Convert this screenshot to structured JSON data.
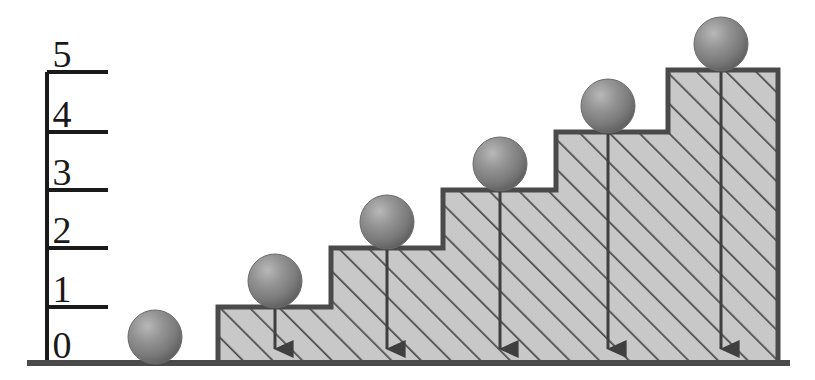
{
  "figure": {
    "background_color": "#ffffff",
    "line_color": "#4a4a4a",
    "axis_color": "#1a1a1a",
    "hatch_fill_color": "#c8c8c8",
    "hatch_line_color": "#4a4a4a",
    "ball_color": "#808080",
    "ball_highlight_color": "#b5b5b5",
    "ball_shadow_color": "#555555"
  },
  "axis": {
    "name": "vertical-level-axis",
    "x": 47,
    "top_y": 72,
    "bottom_y": 363,
    "tick_end_x": 108,
    "labels": [
      "0",
      "1",
      "2",
      "3",
      "4",
      "5"
    ],
    "tick_y": [
      363,
      307,
      248,
      190,
      132,
      72
    ],
    "label_x": [
      62,
      62,
      62,
      62,
      62,
      62
    ],
    "label_y": [
      362,
      306,
      247,
      189,
      131,
      71
    ]
  },
  "ground": {
    "name": "ground-line",
    "x1": 27,
    "x2": 790,
    "y": 363
  },
  "chart_data": {
    "type": "bar",
    "title": "Staircase of levels with spheres",
    "xlabel": "",
    "ylabel": "level",
    "ylim": [
      0,
      5
    ],
    "categories": [
      "0",
      "1",
      "2",
      "3",
      "4",
      "5"
    ],
    "values": [
      0,
      1,
      2,
      3,
      4,
      5
    ],
    "grid": false,
    "legend": null
  },
  "steps": [
    {
      "name": "step-level-0",
      "level": 0,
      "x_left": 27,
      "x_right": 218,
      "top_y": 363,
      "filled": false
    },
    {
      "name": "step-level-1",
      "level": 1,
      "x_left": 218,
      "x_right": 331,
      "top_y": 307,
      "filled": true
    },
    {
      "name": "step-level-2",
      "level": 2,
      "x_left": 331,
      "x_right": 443,
      "top_y": 248,
      "filled": true
    },
    {
      "name": "step-level-3",
      "level": 3,
      "x_left": 443,
      "x_right": 556,
      "top_y": 190,
      "filled": true
    },
    {
      "name": "step-level-4",
      "level": 4,
      "x_left": 556,
      "x_right": 668,
      "top_y": 132,
      "filled": true
    },
    {
      "name": "step-level-5",
      "level": 5,
      "x_left": 668,
      "x_right": 778,
      "top_y": 70,
      "filled": true
    }
  ],
  "balls": [
    {
      "name": "ball-level-0",
      "level": 0,
      "cx": 155,
      "cy": 337,
      "r": 27,
      "has_arrow": false
    },
    {
      "name": "ball-level-1",
      "level": 1,
      "cx": 275,
      "cy": 281,
      "r": 27,
      "has_arrow": true
    },
    {
      "name": "ball-level-2",
      "level": 2,
      "cx": 387,
      "cy": 222,
      "r": 27,
      "has_arrow": true
    },
    {
      "name": "ball-level-3",
      "level": 3,
      "cx": 500,
      "cy": 164,
      "r": 27,
      "has_arrow": true
    },
    {
      "name": "ball-level-4",
      "level": 4,
      "cx": 608,
      "cy": 106,
      "r": 27,
      "has_arrow": true
    },
    {
      "name": "ball-level-5",
      "level": 5,
      "cx": 721,
      "cy": 44,
      "r": 27,
      "has_arrow": true
    }
  ],
  "arrows": [
    {
      "name": "arrow-level-1",
      "x": 275,
      "y_start": 281,
      "y_end": 361
    },
    {
      "name": "arrow-level-2",
      "x": 387,
      "y_start": 222,
      "y_end": 361
    },
    {
      "name": "arrow-level-3",
      "x": 500,
      "y_start": 164,
      "y_end": 361
    },
    {
      "name": "arrow-level-4",
      "x": 608,
      "y_start": 106,
      "y_end": 361
    },
    {
      "name": "arrow-level-5",
      "x": 721,
      "y_start": 44,
      "y_end": 361
    }
  ]
}
